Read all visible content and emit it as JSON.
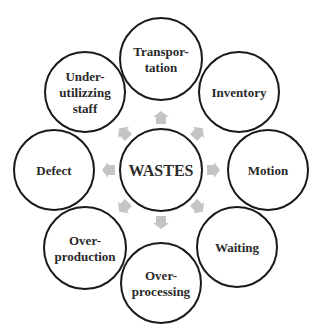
{
  "colors": {
    "background": "#ffffff",
    "circle_stroke": "#1a1a1a",
    "text": "#2a2a2a",
    "arrow": "#c4c4c4"
  },
  "center": {
    "label": "WASTES",
    "cx": 161,
    "cy": 170,
    "r": 41
  },
  "nodes": [
    {
      "id": "transportation",
      "lines": [
        "Transpor-",
        "tation"
      ],
      "cx": 161,
      "cy": 59,
      "r": 41,
      "angle": 270
    },
    {
      "id": "inventory",
      "lines": [
        "Inventory"
      ],
      "cx": 239,
      "cy": 92,
      "r": 40,
      "angle": 315
    },
    {
      "id": "motion",
      "lines": [
        "Motion"
      ],
      "cx": 268,
      "cy": 170,
      "r": 40,
      "angle": 0
    },
    {
      "id": "waiting",
      "lines": [
        "Waiting"
      ],
      "cx": 237,
      "cy": 247,
      "r": 40,
      "angle": 45
    },
    {
      "id": "over-processing",
      "lines": [
        "Over-",
        "processing"
      ],
      "cx": 161,
      "cy": 283,
      "r": 40,
      "angle": 90
    },
    {
      "id": "over-production",
      "lines": [
        "Over-",
        "production"
      ],
      "cx": 85,
      "cy": 248,
      "r": 41,
      "angle": 135
    },
    {
      "id": "defect",
      "lines": [
        "Defect"
      ],
      "cx": 54,
      "cy": 170,
      "r": 40,
      "angle": 180
    },
    {
      "id": "under-utilizing-staff",
      "lines": [
        "Under-",
        "utilizzing",
        "staff"
      ],
      "cx": 85,
      "cy": 92,
      "r": 40,
      "angle": 225
    }
  ],
  "arrows": {
    "distance": 52,
    "count": 8
  }
}
